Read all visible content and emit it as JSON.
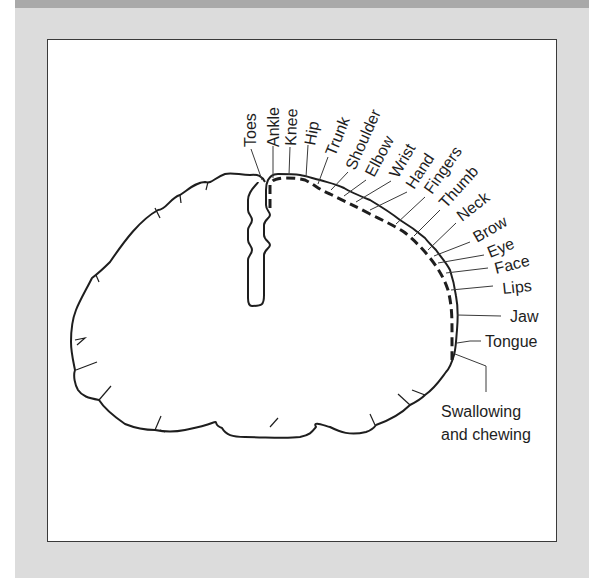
{
  "figure": {
    "type": "motor homunculus cortical map",
    "line_color": "#1e1e1e",
    "background": "#dcdcdc",
    "labels": [
      {
        "id": "toes",
        "text": "Toes"
      },
      {
        "id": "ankle",
        "text": "Ankle"
      },
      {
        "id": "knee",
        "text": "Knee"
      },
      {
        "id": "hip",
        "text": "Hip"
      },
      {
        "id": "trunk",
        "text": "Trunk"
      },
      {
        "id": "shoulder",
        "text": "Shoulder"
      },
      {
        "id": "elbow",
        "text": "Elbow"
      },
      {
        "id": "wrist",
        "text": "Wrist"
      },
      {
        "id": "hand",
        "text": "Hand"
      },
      {
        "id": "fingers",
        "text": "Fingers"
      },
      {
        "id": "thumb",
        "text": "Thumb"
      },
      {
        "id": "neck",
        "text": "Neck"
      },
      {
        "id": "brow",
        "text": "Brow"
      },
      {
        "id": "eye",
        "text": "Eye"
      },
      {
        "id": "face",
        "text": "Face"
      },
      {
        "id": "lips",
        "text": "Lips"
      },
      {
        "id": "jaw",
        "text": "Jaw"
      },
      {
        "id": "tongue",
        "text": "Tongue"
      },
      {
        "id": "swallowing1",
        "text": "Swallowing"
      },
      {
        "id": "swallowing2",
        "text": "and chewing"
      }
    ]
  }
}
